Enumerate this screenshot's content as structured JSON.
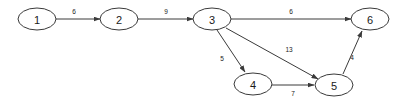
{
  "diagram": {
    "type": "directed-weighted-graph",
    "colors": {
      "background": "#ffffff",
      "stroke": "#3a3a3a",
      "text": "#1a1a1a"
    },
    "nodes": [
      {
        "id": "1",
        "label": "1",
        "cx": 37,
        "cy": 19,
        "rx": 19,
        "ry": 11
      },
      {
        "id": "2",
        "label": "2",
        "cx": 119,
        "cy": 19,
        "rx": 19,
        "ry": 11
      },
      {
        "id": "3",
        "label": "3",
        "cx": 212,
        "cy": 19,
        "rx": 19,
        "ry": 11
      },
      {
        "id": "4",
        "label": "4",
        "cx": 253,
        "cy": 84,
        "rx": 19,
        "ry": 11
      },
      {
        "id": "5",
        "label": "5",
        "cx": 334,
        "cy": 85,
        "rx": 19,
        "ry": 11
      },
      {
        "id": "6",
        "label": "6",
        "cx": 370,
        "cy": 19,
        "rx": 19,
        "ry": 11
      }
    ],
    "edges": [
      {
        "id": "e1",
        "from": "1",
        "to": "2",
        "weight": "6",
        "x1": 56,
        "y1": 19,
        "x2": 100,
        "y2": 19,
        "lx": 74,
        "ly": 11
      },
      {
        "id": "e2",
        "from": "2",
        "to": "3",
        "weight": "9",
        "x1": 138,
        "y1": 19,
        "x2": 193,
        "y2": 19,
        "lx": 166,
        "ly": 11
      },
      {
        "id": "e3",
        "from": "3",
        "to": "6",
        "weight": "6",
        "x1": 231,
        "y1": 19,
        "x2": 351,
        "y2": 19,
        "lx": 291,
        "ly": 11
      },
      {
        "id": "e4",
        "from": "3",
        "to": "4",
        "weight": "5",
        "x1": 217,
        "y1": 30,
        "x2": 245,
        "y2": 72,
        "lx": 222,
        "ly": 58
      },
      {
        "id": "e5",
        "from": "3",
        "to": "5",
        "weight": "13",
        "x1": 226,
        "y1": 28,
        "x2": 318,
        "y2": 79,
        "lx": 289,
        "ly": 49
      },
      {
        "id": "e6",
        "from": "4",
        "to": "5",
        "weight": "7",
        "x1": 272,
        "y1": 85,
        "x2": 314,
        "y2": 85,
        "lx": 293,
        "ly": 93
      },
      {
        "id": "e7",
        "from": "5",
        "to": "6",
        "weight": "4",
        "x1": 343,
        "y1": 74,
        "x2": 362,
        "y2": 31,
        "lx": 352,
        "ly": 57
      }
    ]
  }
}
